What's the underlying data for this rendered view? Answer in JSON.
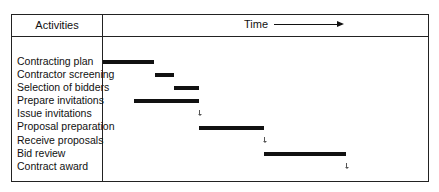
{
  "header": {
    "activities_label": "Activities",
    "time_label": "Time"
  },
  "chart_data": {
    "type": "gantt",
    "title": "",
    "xlabel": "Time",
    "ylabel": "Activities",
    "tasks": [
      {
        "name": "Contracting plan",
        "type": "bar",
        "start": 0,
        "end": 51
      },
      {
        "name": "Contractor screening",
        "type": "bar",
        "start": 52,
        "end": 71
      },
      {
        "name": "Selection of bidders",
        "type": "bar",
        "start": 71,
        "end": 96
      },
      {
        "name": "Prepare invitations",
        "type": "bar",
        "start": 31,
        "end": 96
      },
      {
        "name": "Issue invitations",
        "type": "milestone",
        "at": 96
      },
      {
        "name": "Proposal preparation",
        "type": "bar",
        "start": 96,
        "end": 161
      },
      {
        "name": "Receive proposals",
        "type": "milestone",
        "at": 161
      },
      {
        "name": "Bid review",
        "type": "bar",
        "start": 161,
        "end": 243
      },
      {
        "name": "Contract award",
        "type": "milestone",
        "at": 243
      }
    ]
  },
  "activities": [
    "Contracting plan",
    "Contractor screening",
    "Selection of bidders",
    "Prepare invitations",
    "Issue invitations",
    "Proposal preparation",
    "Receive proposals",
    "Bid review",
    "Contract award"
  ]
}
